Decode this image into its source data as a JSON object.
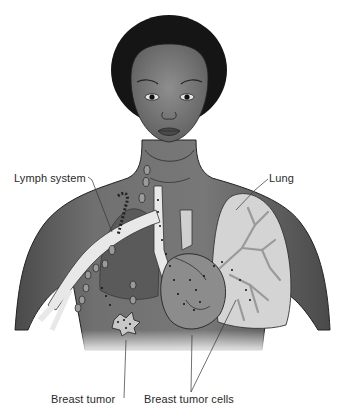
{
  "diagram": {
    "labels": {
      "lymph_system": "Lymph system",
      "lung": "Lung",
      "breast_tumor": "Breast tumor",
      "breast_tumor_cells": "Breast tumor cells"
    },
    "colors": {
      "skin": "#6a6a6a",
      "hair": "#151515",
      "lung": "#d4d4d4",
      "vessels": "#e8e8e8",
      "heart": "#8c8c8c",
      "background": "#ffffff"
    }
  }
}
